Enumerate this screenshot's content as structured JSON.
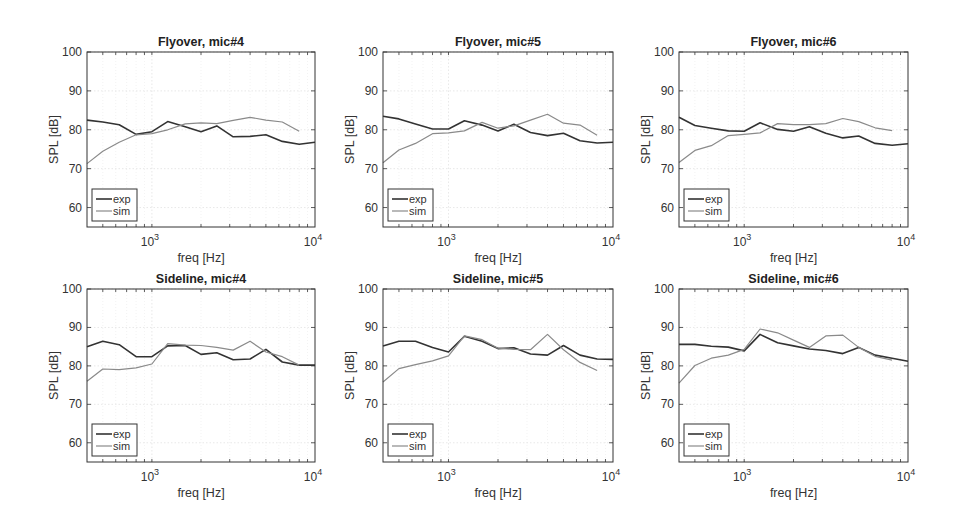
{
  "chart_data": [
    {
      "type": "line",
      "title": "Flyover, mic#4",
      "xlabel": "freq [Hz]",
      "ylabel": "SPL [dB]",
      "xscale": "log",
      "xlim": [
        400,
        10000
      ],
      "ylim": [
        55,
        100
      ],
      "yticks": [
        60,
        70,
        80,
        90,
        100
      ],
      "xticks": [
        "10^3",
        "10^4"
      ],
      "grid": true,
      "legend": {
        "position": "lower left",
        "entries": [
          "exp",
          "sim"
        ]
      },
      "series": [
        {
          "name": "exp",
          "x": [
            400,
            500,
            630,
            800,
            1000,
            1250,
            1600,
            2000,
            2500,
            3150,
            4000,
            5000,
            6300,
            8000,
            10000
          ],
          "values": [
            82.5,
            82,
            81.3,
            78.8,
            79.5,
            82.1,
            80.8,
            79.5,
            81,
            78.2,
            78.3,
            78.7,
            77,
            76.3,
            76.8
          ]
        },
        {
          "name": "sim",
          "x": [
            400,
            500,
            630,
            800,
            1000,
            1250,
            1600,
            2000,
            2500,
            3150,
            4000,
            5000,
            6300,
            8000
          ],
          "values": [
            71.3,
            74.5,
            76.8,
            78.7,
            79,
            80,
            81.5,
            81.8,
            81.6,
            82.4,
            83.2,
            82.5,
            82,
            79.6
          ]
        }
      ]
    },
    {
      "type": "line",
      "title": "Flyover, mic#5",
      "xlabel": "freq [Hz]",
      "ylabel": "SPL [dB]",
      "xscale": "log",
      "xlim": [
        400,
        10000
      ],
      "ylim": [
        55,
        100
      ],
      "yticks": [
        60,
        70,
        80,
        90,
        100
      ],
      "xticks": [
        "10^3",
        "10^4"
      ],
      "grid": true,
      "legend": {
        "position": "lower left",
        "entries": [
          "exp",
          "sim"
        ]
      },
      "series": [
        {
          "name": "exp",
          "x": [
            400,
            500,
            630,
            800,
            1000,
            1250,
            1600,
            2000,
            2500,
            3150,
            4000,
            5000,
            6300,
            8000,
            10000
          ],
          "values": [
            83.5,
            82.8,
            81.5,
            80.2,
            80.2,
            82.3,
            81.2,
            79.7,
            81.4,
            79.3,
            78.5,
            79.1,
            77.2,
            76.6,
            76.8
          ]
        },
        {
          "name": "sim",
          "x": [
            400,
            500,
            630,
            800,
            1000,
            1250,
            1600,
            2000,
            2500,
            3150,
            4000,
            5000,
            6300,
            8000
          ],
          "values": [
            71.5,
            74.8,
            76.5,
            79,
            79.2,
            79.7,
            81.9,
            80.4,
            81,
            82.5,
            84,
            81.7,
            81.2,
            78.6
          ]
        }
      ]
    },
    {
      "type": "line",
      "title": "Flyover, mic#6",
      "xlabel": "freq [Hz]",
      "ylabel": "SPL [dB]",
      "xscale": "log",
      "xlim": [
        400,
        10000
      ],
      "ylim": [
        55,
        100
      ],
      "yticks": [
        60,
        70,
        80,
        90,
        100
      ],
      "xticks": [
        "10^3",
        "10^4"
      ],
      "grid": true,
      "legend": {
        "position": "lower left",
        "entries": [
          "exp",
          "sim"
        ]
      },
      "series": [
        {
          "name": "exp",
          "x": [
            400,
            500,
            630,
            800,
            1000,
            1250,
            1600,
            2000,
            2500,
            3150,
            4000,
            5000,
            6300,
            8000,
            10000
          ],
          "values": [
            83.2,
            81.1,
            80.4,
            79.7,
            79.6,
            81.8,
            80.1,
            79.6,
            80.8,
            79.1,
            77.9,
            78.4,
            76.5,
            76,
            76.4
          ]
        },
        {
          "name": "sim",
          "x": [
            400,
            500,
            630,
            800,
            1000,
            1250,
            1600,
            2000,
            2500,
            3150,
            4000,
            5000,
            6300,
            8000
          ],
          "values": [
            71.6,
            74.7,
            75.9,
            78.5,
            78.8,
            79.2,
            81.6,
            81.3,
            81.3,
            81.6,
            82.9,
            82.1,
            80.5,
            79.8
          ]
        }
      ]
    },
    {
      "type": "line",
      "title": "Sideline, mic#4",
      "xlabel": "freq [Hz]",
      "ylabel": "SPL [dB]",
      "xscale": "log",
      "xlim": [
        400,
        10000
      ],
      "ylim": [
        55,
        100
      ],
      "yticks": [
        60,
        70,
        80,
        90,
        100
      ],
      "xticks": [
        "10^3",
        "10^4"
      ],
      "grid": true,
      "legend": {
        "position": "lower left",
        "entries": [
          "exp",
          "sim"
        ]
      },
      "series": [
        {
          "name": "exp",
          "x": [
            400,
            500,
            630,
            800,
            1000,
            1250,
            1600,
            2000,
            2500,
            3150,
            4000,
            5000,
            6300,
            8000,
            10000
          ],
          "values": [
            85,
            86.4,
            85.5,
            82.4,
            82.4,
            85.2,
            85.3,
            83,
            83.4,
            81.6,
            81.8,
            84.3,
            81,
            80.2,
            80.2
          ]
        },
        {
          "name": "sim",
          "x": [
            400,
            500,
            630,
            800,
            1000,
            1250,
            1600,
            2000,
            2500,
            3150,
            4000,
            5000,
            6300,
            8000
          ],
          "values": [
            76,
            79.2,
            79,
            79.5,
            80.5,
            85.8,
            85.4,
            85.3,
            84.8,
            84.1,
            86.4,
            83.6,
            82.4,
            80.2
          ]
        }
      ]
    },
    {
      "type": "line",
      "title": "Sideline, mic#5",
      "xlabel": "freq [Hz]",
      "ylabel": "SPL [dB]",
      "xscale": "log",
      "xlim": [
        400,
        10000
      ],
      "ylim": [
        55,
        100
      ],
      "yticks": [
        60,
        70,
        80,
        90,
        100
      ],
      "xticks": [
        "10^3",
        "10^4"
      ],
      "grid": true,
      "legend": {
        "position": "lower left",
        "entries": [
          "exp",
          "sim"
        ]
      },
      "series": [
        {
          "name": "exp",
          "x": [
            400,
            500,
            630,
            800,
            1000,
            1250,
            1600,
            2000,
            2500,
            3150,
            4000,
            5000,
            6300,
            8000,
            10000
          ],
          "values": [
            85.2,
            86.4,
            86.4,
            84.8,
            83.6,
            87.7,
            86.4,
            84.5,
            84.7,
            83.1,
            82.8,
            85.3,
            82.8,
            81.8,
            81.7
          ]
        },
        {
          "name": "sim",
          "x": [
            400,
            500,
            630,
            800,
            1000,
            1250,
            1600,
            2000,
            2500,
            3150,
            4000,
            5000,
            6300,
            8000
          ],
          "values": [
            75.8,
            79.3,
            80.3,
            81.3,
            82.6,
            87.8,
            86.8,
            84.6,
            84.3,
            84.2,
            88.2,
            84.2,
            80.9,
            78.8
          ]
        }
      ]
    },
    {
      "type": "line",
      "title": "Sideline, mic#6",
      "xlabel": "freq [Hz]",
      "ylabel": "SPL [dB]",
      "xscale": "log",
      "xlim": [
        400,
        10000
      ],
      "ylim": [
        55,
        100
      ],
      "yticks": [
        60,
        70,
        80,
        90,
        100
      ],
      "xticks": [
        "10^3",
        "10^4"
      ],
      "grid": true,
      "legend": {
        "position": "lower left",
        "entries": [
          "exp",
          "sim"
        ]
      },
      "series": [
        {
          "name": "exp",
          "x": [
            400,
            500,
            630,
            800,
            1000,
            1250,
            1600,
            2000,
            2500,
            3150,
            4000,
            5000,
            6300,
            8000,
            10000
          ],
          "values": [
            85.6,
            85.6,
            85.1,
            84.9,
            83.9,
            88.2,
            86,
            85.2,
            84.4,
            84,
            83.2,
            84.8,
            82.8,
            82,
            81.2
          ]
        },
        {
          "name": "sim",
          "x": [
            400,
            500,
            630,
            800,
            1000,
            1250,
            1600,
            2000,
            2500,
            3150,
            4000,
            5000,
            6300,
            8000
          ],
          "values": [
            75.5,
            80.1,
            82,
            82.8,
            84.3,
            89.6,
            88.6,
            86.7,
            84.8,
            87.8,
            88,
            84.8,
            82.5,
            81.5
          ]
        }
      ]
    }
  ]
}
